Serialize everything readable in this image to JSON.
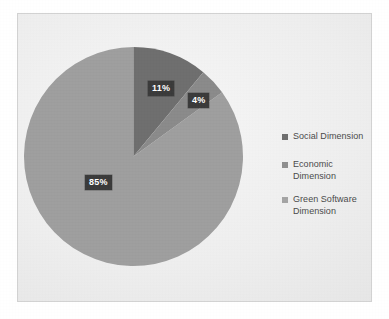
{
  "chart_data": {
    "type": "pie",
    "title": "",
    "categories": [
      "Social Dimension",
      "Economic Dimension",
      "Green Software Dimension"
    ],
    "values": [
      11,
      4,
      85
    ],
    "value_labels": [
      "11%",
      "4%",
      "85%"
    ],
    "units": "percent",
    "start_angle_deg": 0,
    "direction": "clockwise",
    "legend_position": "right",
    "grid": false,
    "slice_colors": [
      "#6e6e6e",
      "#8a8a8a",
      "#9e9e9e"
    ],
    "data_label_text_color": "#ffffff",
    "data_label_background": "#3a3a3a",
    "slices": [
      {
        "name": "Social Dimension",
        "value": 11,
        "label": "11%",
        "color": "#6e6e6e"
      },
      {
        "name": "Economic Dimension",
        "value": 4,
        "label": "4%",
        "color": "#8a8a8a"
      },
      {
        "name": "Green Software Dimension",
        "value": 85,
        "label": "85%",
        "color": "#9e9e9e"
      }
    ]
  },
  "legend": {
    "items": [
      {
        "label": "Social Dimension",
        "color": "#6e6e6e"
      },
      {
        "label": "Economic Dimension",
        "color": "#8f8f8f"
      },
      {
        "label": "Green Software Dimension",
        "color": "#a4a4a4"
      }
    ]
  },
  "frame": {
    "border_color": "#d2d2d2",
    "background_color": "#eeeeee"
  }
}
